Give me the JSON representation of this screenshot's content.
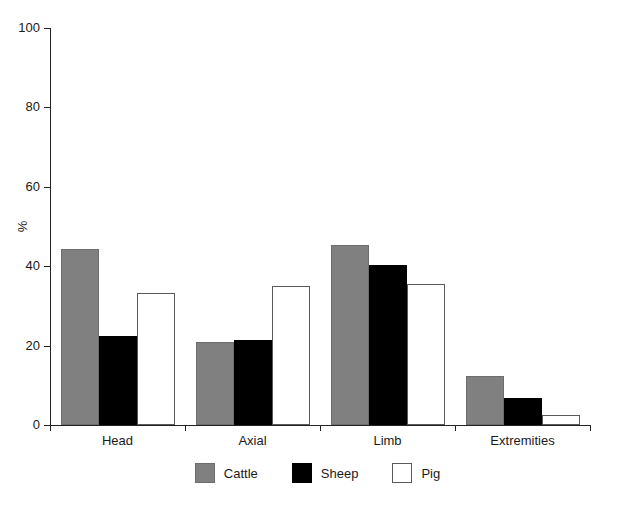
{
  "chart_data": {
    "type": "bar",
    "title": "",
    "xlabel": "",
    "ylabel": "%",
    "categories": [
      "Head",
      "Axial",
      "Limb",
      "Extremities"
    ],
    "series": [
      {
        "name": "Cattle",
        "color": "#808080",
        "values": [
          44.4,
          21.0,
          45.3,
          12.4
        ]
      },
      {
        "name": "Sheep",
        "color": "#000000",
        "values": [
          22.4,
          21.5,
          40.3,
          6.7
        ]
      },
      {
        "name": "Pig",
        "color": "#ffffff",
        "values": [
          33.3,
          35.0,
          35.6,
          2.6
        ]
      }
    ],
    "ylim": [
      0,
      100
    ],
    "yticks": [
      0,
      20,
      40,
      60,
      80,
      100
    ],
    "ytick_labels": [
      "0",
      "20",
      "40",
      "60",
      "80",
      "100"
    ],
    "grid": false,
    "legend_position": "bottom"
  },
  "axes": {
    "y_title": "%",
    "y_ticks": [
      {
        "value": 100,
        "label": "100"
      },
      {
        "value": 80,
        "label": "80"
      },
      {
        "value": 60,
        "label": "60"
      },
      {
        "value": 40,
        "label": "40"
      },
      {
        "value": 20,
        "label": "20"
      },
      {
        "value": 0,
        "label": "0"
      }
    ],
    "x_groups": [
      {
        "label": "Head"
      },
      {
        "label": "Axial"
      },
      {
        "label": "Limb"
      },
      {
        "label": "Extremities"
      }
    ]
  },
  "legend": {
    "items": [
      {
        "label": "Cattle",
        "swatch": "cattle-swatch"
      },
      {
        "label": "Sheep",
        "swatch": "sheep-swatch"
      },
      {
        "label": "Pig",
        "swatch": "pig-swatch"
      }
    ]
  }
}
